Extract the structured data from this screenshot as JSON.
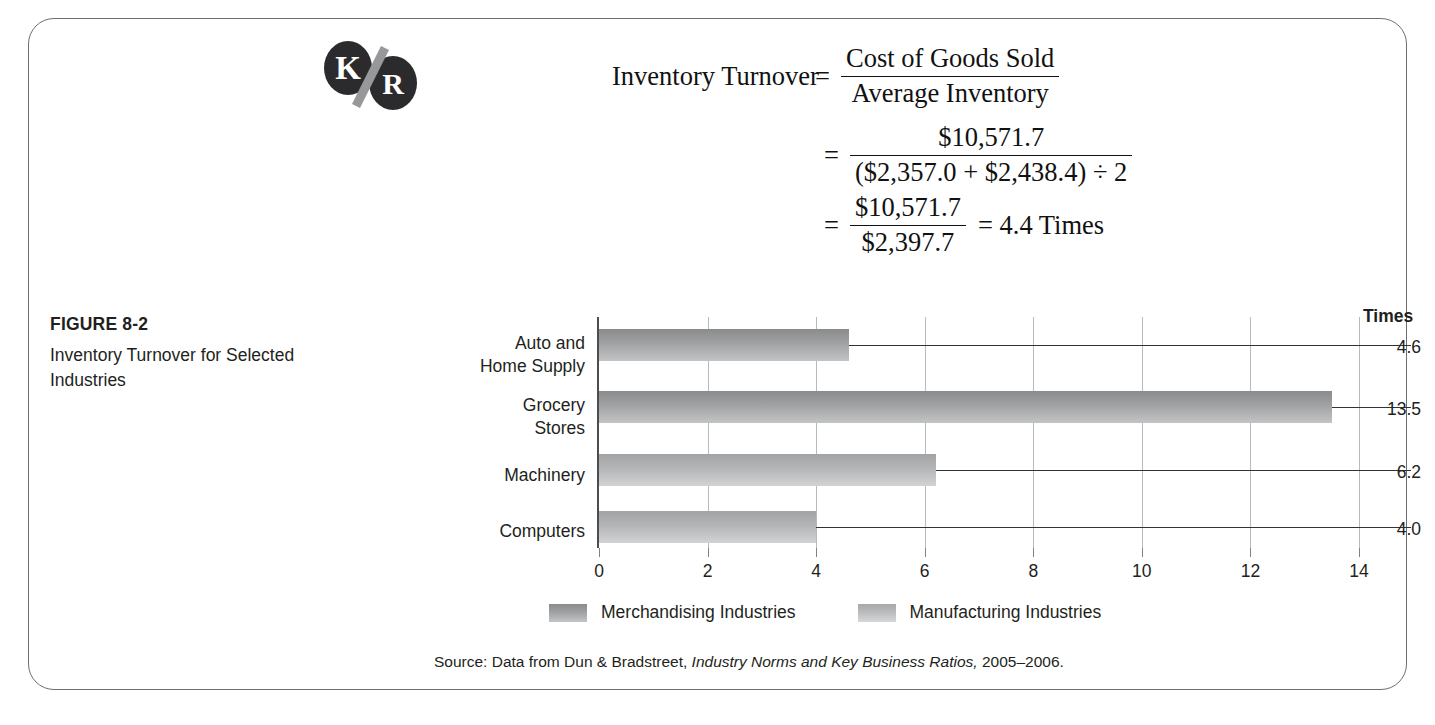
{
  "logo": {
    "left_letter": "K",
    "right_letter": "R",
    "slash": "/",
    "name": "kr-logo"
  },
  "formula": {
    "line1": {
      "lhs": "Inventory Turnover",
      "equals": "=",
      "numerator": "Cost of Goods Sold",
      "denominator": "Average Inventory"
    },
    "line2": {
      "equals": "=",
      "numerator": "$10,571.7",
      "denominator": "($2,357.0 + $2,438.4) ÷ 2"
    },
    "line3": {
      "equals": "=",
      "numerator": "$10,571.7",
      "denominator": "$2,397.7",
      "result": "= 4.4 Times"
    }
  },
  "caption": {
    "title": "FIGURE 8-2",
    "description": "Inventory Turnover for Selected Industries"
  },
  "chart_data": {
    "type": "bar",
    "orientation": "horizontal",
    "title": "Inventory Turnover for Selected Industries",
    "xlabel": "",
    "ylabel": "",
    "value_axis_header": "Times",
    "categories": [
      "Auto and\nHome Supply",
      "Grocery\nStores",
      "Machinery",
      "Computers"
    ],
    "category_lines": [
      [
        "Auto and",
        "Home Supply"
      ],
      [
        "Grocery",
        "Stores"
      ],
      [
        "Machinery"
      ],
      [
        "Computers"
      ]
    ],
    "values": [
      4.6,
      13.5,
      6.2,
      4.0
    ],
    "value_labels": [
      "4.6",
      "13.5",
      "6.2",
      "4.0"
    ],
    "series_of_bar": [
      "Merchandising Industries",
      "Merchandising Industries",
      "Manufacturing Industries",
      "Manufacturing Industries"
    ],
    "xlim": [
      0,
      14
    ],
    "xticks": [
      0,
      2,
      4,
      6,
      8,
      10,
      12,
      14
    ],
    "xtick_labels": [
      "0",
      "2",
      "4",
      "6",
      "8",
      "10",
      "12",
      "14"
    ],
    "grid": true,
    "legend_position": "bottom",
    "legend": [
      {
        "label": "Merchandising Industries",
        "shade": "dark"
      },
      {
        "label": "Manufacturing Industries",
        "shade": "light"
      }
    ]
  },
  "source": {
    "prefix": "Source: Data from Dun & Bradstreet, ",
    "italic_title": "Industry Norms and Key Business Ratios,",
    "suffix": " 2005–2006."
  },
  "colors": {
    "frame_border": "#6e6f71",
    "text": "#231f20",
    "bar_dark": "#8a8b8d",
    "bar_light": "#b4b5b7",
    "gridline": "#b9babc",
    "axis": "#4d4d4f"
  }
}
